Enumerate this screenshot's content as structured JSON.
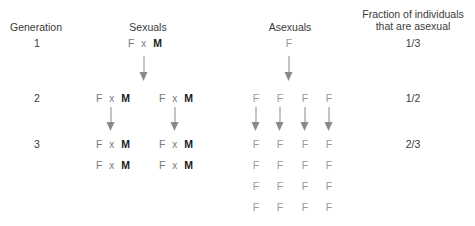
{
  "headers": {
    "generation": "Generation",
    "sexuals": "Sexuals",
    "asexuals": "Asexuals",
    "fraction_line1": "Fraction of individuals",
    "fraction_line2": "that are asexual"
  },
  "symbols": {
    "female": "F",
    "male": "M",
    "cross": "x"
  },
  "generations": [
    {
      "number": "1",
      "fraction": "1/3"
    },
    {
      "number": "2",
      "fraction": "1/2"
    },
    {
      "number": "3",
      "fraction": "2/3"
    }
  ],
  "colors": {
    "female": "#7a7a7a",
    "male": "#1a1a1a",
    "asexual_female": "#9a9a9a",
    "arrow": "#8a8a8a",
    "text": "#3a3a3a"
  }
}
